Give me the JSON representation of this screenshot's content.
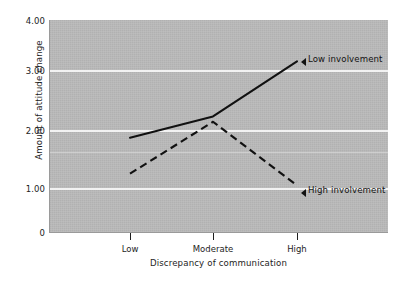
{
  "chart_data": {
    "type": "line",
    "title": "",
    "xlabel": "Discrepancy of communication",
    "ylabel": "Amount of attitude change",
    "categories": [
      "Low",
      "Moderate",
      "High"
    ],
    "ylim": [
      0,
      4.0
    ],
    "ytick_labels": [
      "0",
      "1.00",
      "2.00",
      "3.00",
      "4.00"
    ],
    "ytick_values": [
      0,
      1.0,
      2.0,
      3.0,
      4.0
    ],
    "grid": true,
    "gridline_color": "#f2f2f2",
    "plot_background": "#b9b9b9",
    "legend_position": "inline-right",
    "series": [
      {
        "name": "Low involvement",
        "style": "solid",
        "color": "#111111",
        "values": [
          1.78,
          2.18,
          3.22
        ],
        "annotation": "Low involvement",
        "marker": "left-triangle"
      },
      {
        "name": "High involvement",
        "style": "dashed",
        "color": "#111111",
        "values": [
          1.1,
          2.08,
          0.88
        ],
        "annotation": "High involvement",
        "marker": "left-triangle"
      }
    ]
  },
  "axes": {
    "y_title": "Amount of attitude change",
    "x_title": "Discrepancy of communication",
    "y_ticks": [
      {
        "label": "4.00",
        "value": 4.0
      },
      {
        "label": "3.00",
        "value": 3.0
      },
      {
        "label": "2.00",
        "value": 2.0
      },
      {
        "label": "1.00",
        "value": 1.0
      },
      {
        "label": "0",
        "value": 0
      }
    ],
    "x_ticks": [
      {
        "label": "Low"
      },
      {
        "label": "Moderate"
      },
      {
        "label": "High"
      }
    ]
  },
  "annotations": [
    {
      "text": "Low involvement"
    },
    {
      "text": "High involvement"
    }
  ]
}
